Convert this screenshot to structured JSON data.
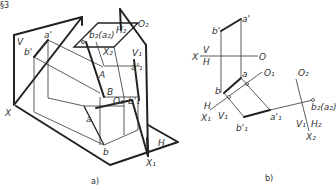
{
  "figure": {
    "corner_mark": "§3",
    "panel_a": {
      "caption": "a)",
      "labels": {
        "V": "V",
        "a_prime": "a'",
        "b_prime": "b'",
        "b2_a2": "b₂(a₂)",
        "H2": "H₂",
        "O2": "O₂",
        "X2": "X₂",
        "V1": "V₁",
        "a1_prime": "a'₁",
        "A": "A",
        "B": "B",
        "O1": "O₁",
        "b1_prime": "b'₁",
        "X": "X",
        "a": "a",
        "b": "b",
        "H": "H",
        "X1": "X₁"
      }
    },
    "panel_b": {
      "caption": "b)",
      "labels": {
        "a_prime": "a'",
        "b_prime": "b'",
        "X": "X",
        "V": "V",
        "H": "H",
        "O": "O",
        "a": "a",
        "b": "b",
        "O1": "O₁",
        "O2": "O₂",
        "H_x1": "H",
        "X1": "X₁",
        "V1_x1": "V₁",
        "b1_prime": "b'₁",
        "a1_prime": "a'₁",
        "b2_a2": "b₂(a₂)",
        "V1_x2": "V₁",
        "H2": "H₂",
        "X2": "X₂"
      }
    }
  }
}
